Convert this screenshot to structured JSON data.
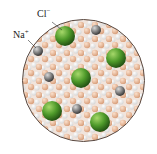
{
  "labels": {
    "chloride": "Cl",
    "chloride_charge": "−",
    "sodium": "Na",
    "sodium_charge": "+"
  },
  "colors": {
    "chloride": "#4e9a2a",
    "sodium": "#8a8a8a",
    "water_o": "#e8b898",
    "water_h": "#f4f4f4",
    "border": "#5a4a42"
  },
  "ions": {
    "chloride": [
      [
        65,
        36
      ],
      [
        116,
        58
      ],
      [
        81,
        78
      ],
      [
        52,
        111
      ],
      [
        100,
        122
      ]
    ],
    "sodium": [
      [
        96,
        30
      ],
      [
        38,
        51
      ],
      [
        49,
        77
      ],
      [
        120,
        91
      ],
      [
        77,
        109
      ]
    ]
  }
}
